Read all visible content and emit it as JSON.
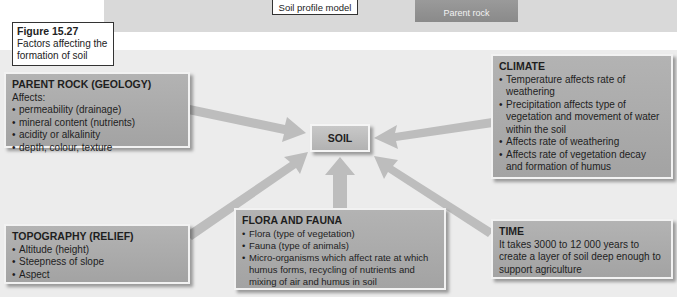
{
  "top": {
    "profile_label": "Soil profile model",
    "parent_rock_label": "Parent rock"
  },
  "figure": {
    "number": "Figure 15.27",
    "caption": "Factors affecting the formation of soil"
  },
  "center": {
    "label": "SOIL"
  },
  "factors": {
    "parent_rock": {
      "title": "PARENT ROCK (GEOLOGY)",
      "intro": "Affects:",
      "items": [
        "permeability (drainage)",
        "mineral content (nutrients)",
        "acidity or alkalinity",
        "depth, colour, texture"
      ]
    },
    "climate": {
      "title": "CLIMATE",
      "items": [
        "Temperature affects rate of weathering",
        "Precipitation affects type of vegetation and movement of water within the soil",
        "Affects rate of weathering",
        "Affects rate of vegetation decay and formation of humus"
      ]
    },
    "topography": {
      "title": "TOPOGRAPHY (RELIEF)",
      "items": [
        "Altitude (height)",
        "Steepness of slope",
        "Aspect"
      ]
    },
    "flora_fauna": {
      "title": "FLORA AND FAUNA",
      "items": [
        "Flora (type of vegetation)",
        "Fauna (type of animals)",
        "Micro-organisms which affect rate at which humus forms, recycling of nutrients and mixing of air and humus in soil"
      ]
    },
    "time": {
      "title": "TIME",
      "text": "It takes 3000 to 12 000 years to create a layer of soil deep enough to support agriculture"
    }
  },
  "colors": {
    "box": "#a8a8a8",
    "arrow": "#bdbdbd",
    "panel": "#ececec"
  }
}
